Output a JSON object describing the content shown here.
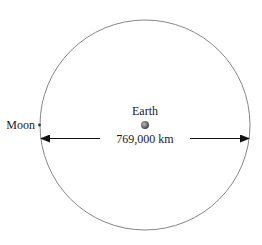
{
  "diagram": {
    "earth_label": "Earth",
    "moon_label": "Moon",
    "distance_label": "769,000 km",
    "colors": {
      "orbit": "#777777",
      "arrow": "#111111",
      "earth": "#666666",
      "moon": "#333333",
      "text": "#1a1a1a"
    }
  }
}
